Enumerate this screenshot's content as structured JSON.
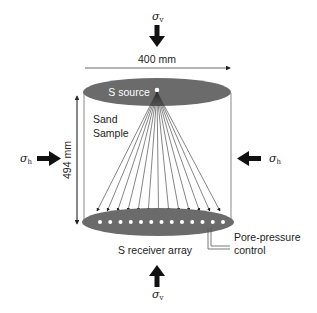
{
  "diagram": {
    "stress_vertical_top": {
      "symbol": "σ",
      "sub": "v"
    },
    "stress_vertical_bottom": {
      "symbol": "σ",
      "sub": "v"
    },
    "stress_horizontal_left": {
      "symbol": "σ",
      "sub": "h"
    },
    "stress_horizontal_right": {
      "symbol": "σ",
      "sub": "h"
    },
    "width_label": "400 mm",
    "height_label": "494 mm",
    "source_label": "S source",
    "sample_label_line1": "Sand",
    "sample_label_line2": "Sample",
    "receiver_label": "S receiver array",
    "pore_label_line1": "Pore-pressure",
    "pore_label_line2": "control",
    "receiver_count": 13,
    "colors": {
      "ellipse": "#6b6b6b",
      "line": "#333333",
      "dot": "#ffffff"
    }
  }
}
